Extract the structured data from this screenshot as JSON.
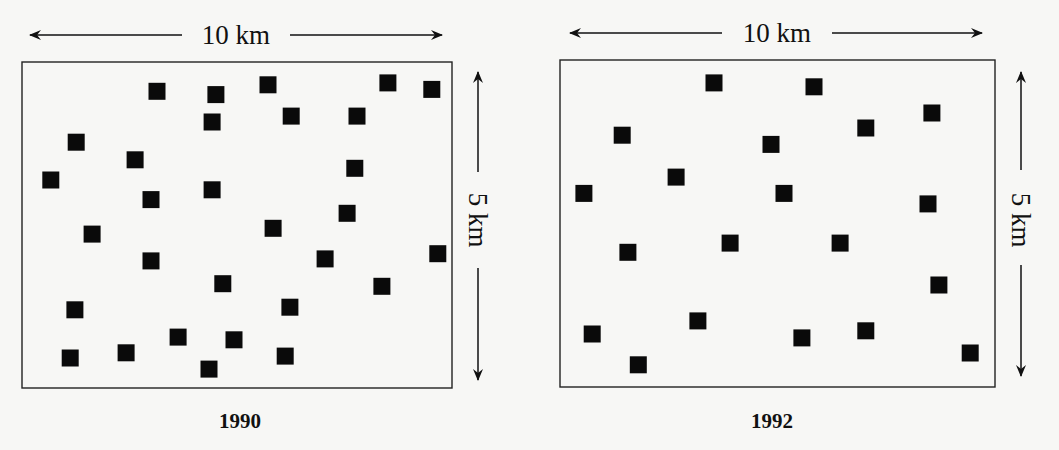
{
  "chart_data": {
    "type": "scatter",
    "title": "",
    "panels": [
      {
        "year_label": "1990",
        "width_label": "10 km",
        "height_label": "5 km",
        "x_range_km": [
          0,
          10
        ],
        "y_range_km": [
          0,
          5
        ],
        "marker": "square",
        "count": 30,
        "points_km": [
          [
            3.14,
            4.55
          ],
          [
            4.51,
            4.5
          ],
          [
            5.72,
            4.65
          ],
          [
            8.51,
            4.68
          ],
          [
            9.53,
            4.58
          ],
          [
            4.42,
            4.08
          ],
          [
            6.26,
            4.17
          ],
          [
            7.79,
            4.17
          ],
          [
            1.26,
            3.77
          ],
          [
            2.63,
            3.5
          ],
          [
            0.67,
            3.19
          ],
          [
            7.74,
            3.37
          ],
          [
            3.0,
            2.89
          ],
          [
            4.42,
            3.04
          ],
          [
            7.56,
            2.68
          ],
          [
            1.63,
            2.36
          ],
          [
            5.84,
            2.45
          ],
          [
            3.0,
            1.95
          ],
          [
            7.05,
            1.98
          ],
          [
            9.67,
            2.06
          ],
          [
            4.67,
            1.6
          ],
          [
            8.37,
            1.56
          ],
          [
            1.23,
            1.2
          ],
          [
            6.23,
            1.24
          ],
          [
            3.63,
            0.78
          ],
          [
            4.93,
            0.74
          ],
          [
            2.42,
            0.54
          ],
          [
            1.12,
            0.46
          ],
          [
            4.35,
            0.29
          ],
          [
            6.12,
            0.49
          ]
        ]
      },
      {
        "year_label": "1992",
        "width_label": "10 km",
        "height_label": "5 km",
        "x_range_km": [
          0,
          10
        ],
        "y_range_km": [
          0,
          5
        ],
        "marker": "square",
        "count": 20,
        "points_km": [
          [
            3.54,
            4.65
          ],
          [
            5.84,
            4.59
          ],
          [
            8.55,
            4.19
          ],
          [
            7.03,
            3.96
          ],
          [
            1.43,
            3.85
          ],
          [
            4.85,
            3.71
          ],
          [
            2.67,
            3.21
          ],
          [
            0.55,
            2.96
          ],
          [
            5.15,
            2.96
          ],
          [
            8.46,
            2.8
          ],
          [
            3.91,
            2.2
          ],
          [
            6.44,
            2.2
          ],
          [
            1.56,
            2.06
          ],
          [
            8.71,
            1.56
          ],
          [
            3.17,
            1.01
          ],
          [
            0.74,
            0.81
          ],
          [
            5.56,
            0.75
          ],
          [
            7.03,
            0.86
          ],
          [
            1.8,
            0.34
          ],
          [
            9.43,
            0.52
          ]
        ]
      }
    ],
    "xlabel": "10 km",
    "ylabel": "5 km"
  }
}
